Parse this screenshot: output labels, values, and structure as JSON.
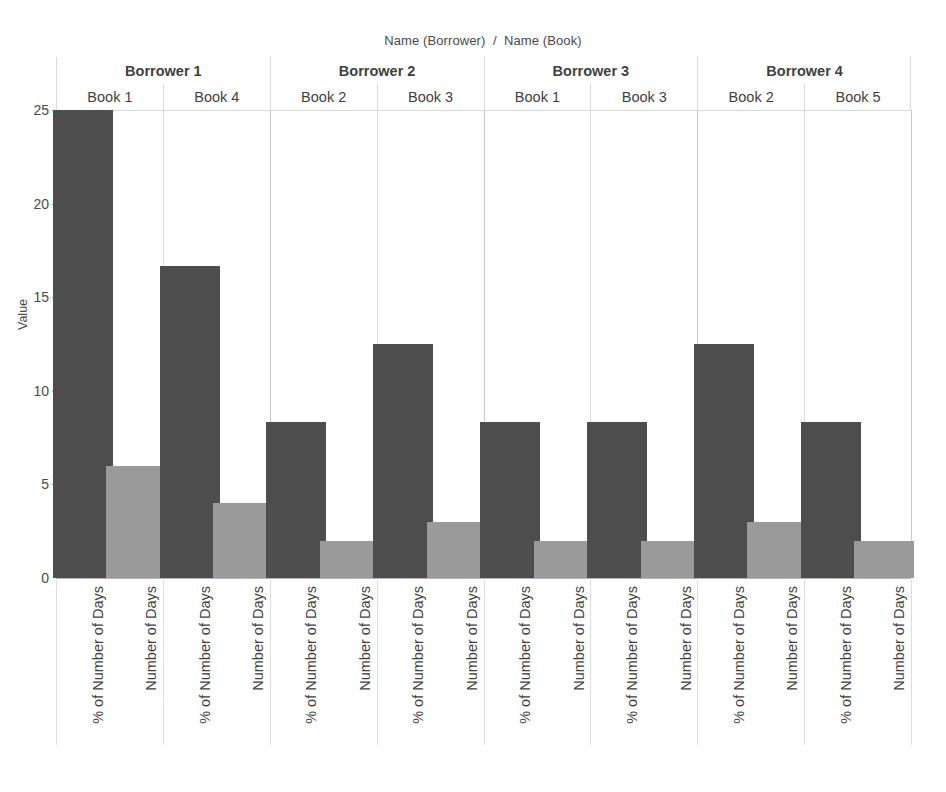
{
  "chart_data": {
    "type": "bar",
    "title": "Name (Borrower)  /  Name (Book)",
    "xlabel": "",
    "ylabel": "Value",
    "ylim": [
      0,
      25
    ],
    "yticks": [
      0,
      5,
      10,
      15,
      20,
      25
    ],
    "ytick_labels": [
      "0",
      "5",
      "10",
      "15",
      "20",
      "25"
    ],
    "grid": false,
    "legend": "none",
    "orientation": "vertical",
    "measures": [
      "% of Number of Days",
      "Number of Days"
    ],
    "colors": {
      "% of Number of Days": "#4d4d4d",
      "Number of Days": "#9a9a9a",
      "axis": "#b5b5b5",
      "divider": "#dcdcdc",
      "text": "#3f3f3f"
    },
    "panels": [
      {
        "borrower": "Borrower 1",
        "books": [
          {
            "book": "Book 1",
            "bars": [
              {
                "measure": "% of Number of Days",
                "value": 25.0
              },
              {
                "measure": "Number of Days",
                "value": 6.0
              }
            ]
          },
          {
            "book": "Book 4",
            "bars": [
              {
                "measure": "% of Number of Days",
                "value": 16.67
              },
              {
                "measure": "Number of Days",
                "value": 4.0
              }
            ]
          }
        ]
      },
      {
        "borrower": "Borrower 2",
        "books": [
          {
            "book": "Book 2",
            "bars": [
              {
                "measure": "% of Number of Days",
                "value": 8.33
              },
              {
                "measure": "Number of Days",
                "value": 2.0
              }
            ]
          },
          {
            "book": "Book 3",
            "bars": [
              {
                "measure": "% of Number of Days",
                "value": 12.5
              },
              {
                "measure": "Number of Days",
                "value": 3.0
              }
            ]
          }
        ]
      },
      {
        "borrower": "Borrower 3",
        "books": [
          {
            "book": "Book 1",
            "bars": [
              {
                "measure": "% of Number of Days",
                "value": 8.33
              },
              {
                "measure": "Number of Days",
                "value": 2.0
              }
            ]
          },
          {
            "book": "Book 3",
            "bars": [
              {
                "measure": "% of Number of Days",
                "value": 8.33
              },
              {
                "measure": "Number of Days",
                "value": 2.0
              }
            ]
          }
        ]
      },
      {
        "borrower": "Borrower 4",
        "books": [
          {
            "book": "Book 2",
            "bars": [
              {
                "measure": "% of Number of Days",
                "value": 12.5
              },
              {
                "measure": "Number of Days",
                "value": 3.0
              }
            ]
          },
          {
            "book": "Book 5",
            "bars": [
              {
                "measure": "% of Number of Days",
                "value": 8.33
              },
              {
                "measure": "Number of Days",
                "value": 2.0
              }
            ]
          }
        ]
      }
    ]
  }
}
